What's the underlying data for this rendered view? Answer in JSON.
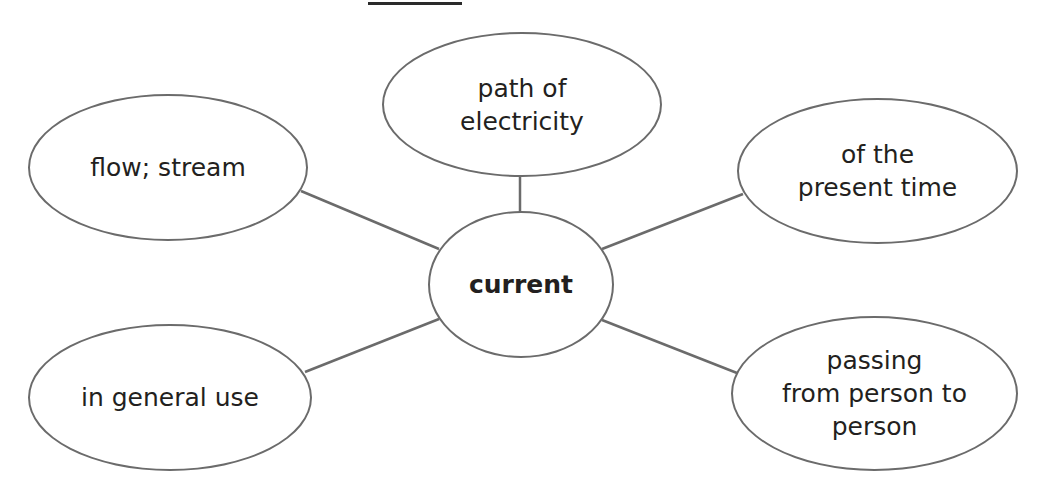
{
  "diagram": {
    "type": "word-web",
    "answer_blank": "",
    "center": {
      "label": "current"
    },
    "nodes": [
      {
        "id": "top",
        "label": "path of\nelectricity"
      },
      {
        "id": "upper-left",
        "label": "flow; stream"
      },
      {
        "id": "upper-right",
        "label": "of the\npresent time"
      },
      {
        "id": "lower-left",
        "label": "in general use"
      },
      {
        "id": "lower-right",
        "label": "passing\nfrom person to\nperson"
      }
    ],
    "colors": {
      "stroke": "#6b6b6b",
      "text": "#231f20",
      "background": "#ffffff"
    }
  }
}
